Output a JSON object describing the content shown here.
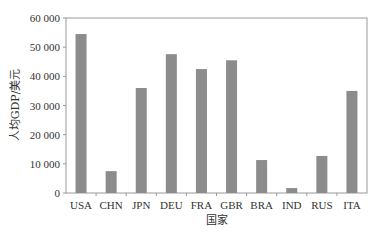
{
  "chart_data": {
    "type": "bar",
    "title": "",
    "xlabel": "国家",
    "ylabel": "人均GDP/美元",
    "categories": [
      "USA",
      "CHN",
      "JPN",
      "DEU",
      "FRA",
      "GBR",
      "BRA",
      "IND",
      "RUS",
      "ITA"
    ],
    "values": [
      54500,
      7500,
      36000,
      47600,
      42500,
      45500,
      11300,
      1700,
      12700,
      35000
    ],
    "ylim": [
      0,
      60000
    ],
    "yticks": [
      0,
      10000,
      20000,
      30000,
      40000,
      50000,
      60000
    ],
    "ytick_labels": [
      "0",
      "10 000",
      "20 000",
      "30 000",
      "40 000",
      "50 000",
      "60 000"
    ],
    "grid": false,
    "legend": null,
    "bar_color": "#8c8c8c",
    "axis_color": "#999999"
  }
}
